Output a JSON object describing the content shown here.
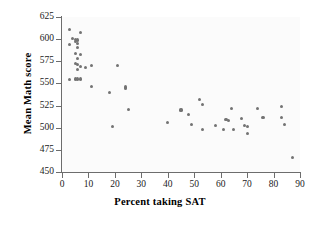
{
  "chart_data": {
    "type": "scatter",
    "title": "",
    "xlabel": "Percent taking SAT",
    "ylabel": "Mean Math score",
    "xlim": [
      0,
      90
    ],
    "ylim": [
      450,
      625
    ],
    "xticks": [
      0,
      10,
      20,
      30,
      40,
      50,
      60,
      70,
      80,
      90
    ],
    "yticks": [
      450,
      475,
      500,
      525,
      550,
      575,
      600,
      625
    ],
    "grid": false,
    "legend": null,
    "marker_color": "#737373",
    "axis_color": "#6d6d6d",
    "background_color": "#fbfbfb",
    "points": [
      {
        "x": 3,
        "y": 611
      },
      {
        "x": 4,
        "y": 601
      },
      {
        "x": 3,
        "y": 594
      },
      {
        "x": 5,
        "y": 600
      },
      {
        "x": 5,
        "y": 597
      },
      {
        "x": 6,
        "y": 599
      },
      {
        "x": 6,
        "y": 595
      },
      {
        "x": 7,
        "y": 607
      },
      {
        "x": 6,
        "y": 591
      },
      {
        "x": 5,
        "y": 584
      },
      {
        "x": 6,
        "y": 578
      },
      {
        "x": 7,
        "y": 583
      },
      {
        "x": 5,
        "y": 573
      },
      {
        "x": 6,
        "y": 571
      },
      {
        "x": 6,
        "y": 566
      },
      {
        "x": 7,
        "y": 569
      },
      {
        "x": 9,
        "y": 568
      },
      {
        "x": 11,
        "y": 570
      },
      {
        "x": 3,
        "y": 554
      },
      {
        "x": 5,
        "y": 555
      },
      {
        "x": 6,
        "y": 555
      },
      {
        "x": 7,
        "y": 555
      },
      {
        "x": 11,
        "y": 547
      },
      {
        "x": 18,
        "y": 540
      },
      {
        "x": 19,
        "y": 501
      },
      {
        "x": 21,
        "y": 570
      },
      {
        "x": 24,
        "y": 546
      },
      {
        "x": 24,
        "y": 544
      },
      {
        "x": 25,
        "y": 521
      },
      {
        "x": 40,
        "y": 506
      },
      {
        "x": 45,
        "y": 520
      },
      {
        "x": 48,
        "y": 515
      },
      {
        "x": 49,
        "y": 504
      },
      {
        "x": 52,
        "y": 532
      },
      {
        "x": 53,
        "y": 526
      },
      {
        "x": 53,
        "y": 498
      },
      {
        "x": 58,
        "y": 503
      },
      {
        "x": 61,
        "y": 498
      },
      {
        "x": 62,
        "y": 509
      },
      {
        "x": 63,
        "y": 508
      },
      {
        "x": 64,
        "y": 522
      },
      {
        "x": 65,
        "y": 498
      },
      {
        "x": 68,
        "y": 510
      },
      {
        "x": 69,
        "y": 502
      },
      {
        "x": 70,
        "y": 501
      },
      {
        "x": 70,
        "y": 493
      },
      {
        "x": 74,
        "y": 522
      },
      {
        "x": 76,
        "y": 512
      },
      {
        "x": 83,
        "y": 524
      },
      {
        "x": 83,
        "y": 512
      },
      {
        "x": 84,
        "y": 504
      },
      {
        "x": 87,
        "y": 466
      }
    ]
  }
}
